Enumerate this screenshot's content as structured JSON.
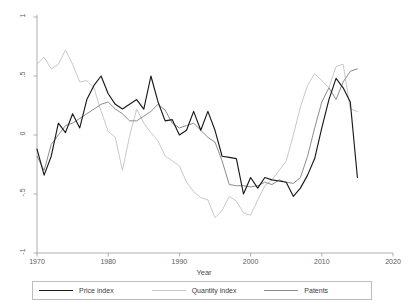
{
  "chart_data": {
    "type": "line",
    "title": "",
    "xlabel": "Year",
    "ylabel": "",
    "xlim": [
      1970,
      2020
    ],
    "ylim": [
      -1,
      1
    ],
    "grid": false,
    "legend_position": "bottom",
    "x_ticks": [
      "1970",
      "1980",
      "1990",
      "2000",
      "2010",
      "2020"
    ],
    "x_tick_values": [
      1970,
      1980,
      1990,
      2000,
      2010,
      2020
    ],
    "y_ticks": [
      "1",
      ".5",
      "0",
      "-.5",
      "-1"
    ],
    "y_tick_values": [
      1,
      0.5,
      0,
      -0.5,
      -1
    ],
    "x": [
      1970,
      1971,
      1972,
      1973,
      1974,
      1975,
      1976,
      1977,
      1978,
      1979,
      1980,
      1981,
      1982,
      1983,
      1984,
      1985,
      1986,
      1987,
      1988,
      1989,
      1990,
      1991,
      1992,
      1993,
      1994,
      1995,
      1996,
      1997,
      1998,
      1999,
      2000,
      2001,
      2002,
      2003,
      2004,
      2005,
      2006,
      2007,
      2008,
      2009,
      2010,
      2011,
      2012,
      2013,
      2014,
      2015
    ],
    "series": [
      {
        "name": "Price index",
        "color": "#1a1a1a",
        "values": [
          -0.12,
          -0.34,
          -0.18,
          0.1,
          0.02,
          0.18,
          0.06,
          0.3,
          0.42,
          0.5,
          0.35,
          0.26,
          0.22,
          0.26,
          0.3,
          0.22,
          0.5,
          0.28,
          0.12,
          0.13,
          0.0,
          0.04,
          0.2,
          0.04,
          0.2,
          0.04,
          -0.18,
          -0.19,
          -0.2,
          -0.5,
          -0.36,
          -0.45,
          -0.36,
          -0.38,
          -0.39,
          -0.4,
          -0.52,
          -0.45,
          -0.34,
          -0.2,
          0.06,
          0.3,
          0.48,
          0.4,
          0.28,
          -0.36
        ]
      },
      {
        "name": "Quantity index",
        "color": "#c9c9c9",
        "values": [
          0.6,
          0.66,
          0.56,
          0.6,
          0.72,
          0.6,
          0.45,
          0.46,
          0.4,
          0.2,
          0.03,
          -0.02,
          -0.3,
          -0.01,
          0.22,
          0.1,
          0.02,
          -0.05,
          -0.18,
          -0.22,
          -0.26,
          -0.4,
          -0.48,
          -0.53,
          -0.55,
          -0.7,
          -0.64,
          -0.52,
          -0.56,
          -0.66,
          -0.68,
          -0.55,
          -0.43,
          -0.38,
          -0.3,
          -0.22,
          0.0,
          0.24,
          0.42,
          0.52,
          0.46,
          0.4,
          0.58,
          0.6,
          0.22,
          0.2
        ]
      },
      {
        "name": "Patents",
        "color": "#8c8c8c",
        "values": [
          -0.18,
          -0.3,
          -0.08,
          0.0,
          0.08,
          0.1,
          0.14,
          0.18,
          0.22,
          0.26,
          0.28,
          0.22,
          0.18,
          0.12,
          0.12,
          0.16,
          0.2,
          0.26,
          0.21,
          0.1,
          0.06,
          0.08,
          0.1,
          0.04,
          -0.02,
          -0.06,
          -0.22,
          -0.42,
          -0.43,
          -0.43,
          -0.44,
          -0.43,
          -0.4,
          -0.42,
          -0.38,
          -0.4,
          -0.41,
          -0.36,
          -0.18,
          0.06,
          0.28,
          0.4,
          0.3,
          0.45,
          0.54,
          0.56
        ]
      }
    ]
  },
  "legend": {
    "items": [
      {
        "label": "Price index"
      },
      {
        "label": "Quantity index"
      },
      {
        "label": "Patents"
      }
    ]
  },
  "axis": {
    "x_title": "Year"
  }
}
